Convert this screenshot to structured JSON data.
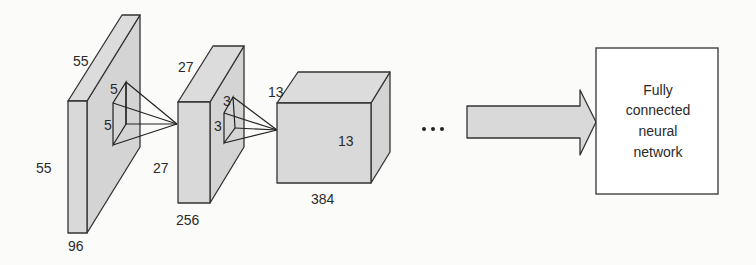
{
  "diagram": {
    "layer1": {
      "height": "55",
      "width": "55",
      "depth": "96",
      "kernel_h": "5",
      "kernel_w": "5"
    },
    "layer2": {
      "height": "27",
      "width": "27",
      "depth": "256",
      "kernel_h": "3",
      "kernel_w": "3"
    },
    "layer3": {
      "height": "13",
      "width": "13",
      "depth": "384"
    },
    "ellipsis": "...",
    "fc_box": {
      "line1": "Fully",
      "line2": "connected",
      "line3": "neural",
      "line4": "network"
    },
    "colors": {
      "fill": "#d9d9d9",
      "stroke": "#333333",
      "background": "#fbfbfa"
    }
  }
}
